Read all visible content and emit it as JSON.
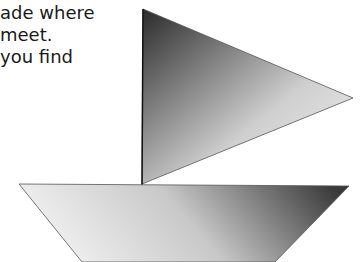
{
  "text": {
    "lines": [
      "ade where",
      "meet.",
      "you find"
    ]
  },
  "figure": {
    "sail": {
      "shape": "triangle",
      "points": "143,9 353,98 142,184",
      "gradient_dark": "#2a2a2a",
      "gradient_light": "#f2f2f2"
    },
    "hull": {
      "shape": "trapezoid",
      "points": "19,184 349,186 275,262 82,262",
      "gradient_dark": "#3a3a3a",
      "gradient_light": "#f4f4f4"
    },
    "mast_color": "#111111"
  }
}
